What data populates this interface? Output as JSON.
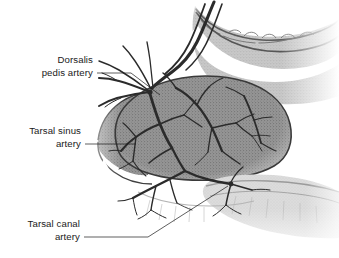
{
  "figure": {
    "background_color": "#ffffff",
    "ink_color": "#1a1a1a",
    "bone_fill_color": "#8c8c8c",
    "bone_light_color": "#bdbdbd",
    "artery_color": "#2b2b2b",
    "outline_color": "#4a4a4a"
  },
  "labels": [
    {
      "id": "dorsalis-pedis-artery",
      "line1": "Dorsalis",
      "line2": "pedis artery",
      "anchor_x": 130,
      "anchor_y": 73
    },
    {
      "id": "tarsal-sinus-artery",
      "line1": "Tarsal sinus",
      "line2": "artery",
      "anchor_x": 118,
      "anchor_y": 144
    },
    {
      "id": "tarsal-canal-artery",
      "line1": "Tarsal canal",
      "line2": "artery",
      "anchor_x": 120,
      "anchor_y": 237
    }
  ],
  "structures": [
    {
      "id": "talus-body",
      "name": "Talus body (stippled bone mass)"
    },
    {
      "id": "tibia-distal",
      "name": "Distal tibia (upper right bone)"
    },
    {
      "id": "calcaneus",
      "name": "Calcaneus (lower right bone)"
    },
    {
      "id": "navicular",
      "name": "Navicular (left tip)"
    },
    {
      "id": "artery-network",
      "name": "Arterial branching network"
    }
  ]
}
